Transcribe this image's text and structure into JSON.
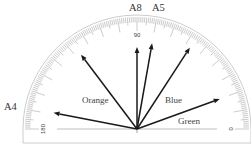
{
  "diagram": {
    "type": "protractor",
    "origin": {
      "x": 137,
      "y": 129
    },
    "outer_radius": 112,
    "inner_radius": 93,
    "scale": {
      "min": 0,
      "max": 180,
      "labels": [
        {
          "text": "180",
          "angle": 180
        },
        {
          "text": "90",
          "angle": 90
        },
        {
          "text": "0",
          "angle": 0
        }
      ]
    },
    "colors": {
      "line": "#1a1a1a",
      "ticks": "#8a8a8a",
      "outline": "#bfbfbf",
      "baseline": "#b0b0b0"
    },
    "arrows": [
      {
        "name": "A4",
        "angle": 169,
        "length": 85,
        "label": "A4",
        "label_pos": {
          "x": 4,
          "y": 110
        },
        "label_class": "top-label"
      },
      {
        "name": "Orange",
        "angle": 127,
        "length": 93,
        "label": "Orange",
        "label_pos": {
          "x": 82,
          "y": 103
        },
        "label_class": "arrow-label"
      },
      {
        "name": "A8",
        "angle": 90,
        "length": 82,
        "label": "A8",
        "label_pos": {
          "x": 129,
          "y": 11
        },
        "label_class": "top-label"
      },
      {
        "name": "A5",
        "angle": 80,
        "length": 87,
        "label": "A5",
        "label_pos": {
          "x": 152,
          "y": 11
        },
        "label_class": "top-label"
      },
      {
        "name": "Blue",
        "angle": 57,
        "length": 97,
        "label": "Blue",
        "label_pos": {
          "x": 165,
          "y": 103
        },
        "label_class": "arrow-label"
      },
      {
        "name": "Green",
        "angle": 20,
        "length": 88,
        "label": "Green",
        "label_pos": {
          "x": 178,
          "y": 124
        },
        "label_class": "arrow-label"
      }
    ]
  }
}
